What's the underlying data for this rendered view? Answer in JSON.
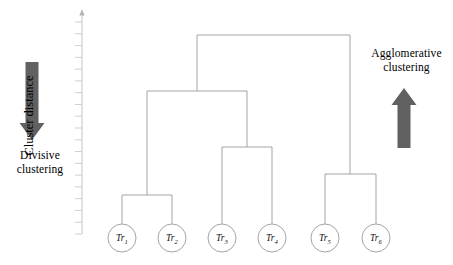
{
  "figure": {
    "type": "dendrogram",
    "background_color": "#ffffff",
    "line_color": "#9a9a9a",
    "arrow_color": "#616161",
    "text_color": "#000000"
  },
  "axis": {
    "title": "Cluster distance",
    "has_arrow_head": true,
    "tick_count": 19,
    "x": 82,
    "top_y": 14,
    "bottom_y": 234,
    "tick_length": 7
  },
  "annotations": {
    "left": {
      "label_line1": "Divisive",
      "label_line2": "clustering",
      "arrow_direction": "down",
      "arrow_name": "down-arrow"
    },
    "right": {
      "label_line1": "Agglomerative",
      "label_line2": "clustering",
      "arrow_direction": "up",
      "arrow_name": "up-arrow"
    }
  },
  "chart_data": {
    "type": "dendrogram",
    "title": "",
    "xlabel": "",
    "ylabel": "Cluster distance",
    "grid": false,
    "legend": "none",
    "leaves": [
      {
        "id": "Tr1",
        "base": "Tr",
        "sub": "1",
        "x": 122,
        "y": 238,
        "radius": 14
      },
      {
        "id": "Tr2",
        "base": "Tr",
        "sub": "2",
        "x": 172,
        "y": 238,
        "radius": 14
      },
      {
        "id": "Tr3",
        "base": "Tr",
        "sub": "3",
        "x": 222,
        "y": 238,
        "radius": 14
      },
      {
        "id": "Tr4",
        "base": "Tr",
        "sub": "4",
        "x": 272,
        "y": 238,
        "radius": 14
      },
      {
        "id": "Tr5",
        "base": "Tr",
        "sub": "5",
        "x": 325,
        "y": 238,
        "radius": 14
      },
      {
        "id": "Tr6",
        "base": "Tr",
        "sub": "6",
        "x": 376,
        "y": 238,
        "radius": 14
      }
    ],
    "merges": [
      {
        "name": "merge-Tr1-Tr2",
        "left_x": 122,
        "right_x": 172,
        "height_y": 195,
        "center_x": 147,
        "children": [
          "Tr1",
          "Tr2"
        ]
      },
      {
        "name": "merge-Tr3-Tr4",
        "left_x": 222,
        "right_x": 272,
        "height_y": 147,
        "center_x": 247,
        "children": [
          "Tr3",
          "Tr4"
        ]
      },
      {
        "name": "merge-Tr5-Tr6",
        "left_x": 325,
        "right_x": 376,
        "height_y": 174,
        "center_x": 350,
        "children": [
          "Tr5",
          "Tr6"
        ]
      },
      {
        "name": "merge-Tr12-Tr34",
        "left_x": 147,
        "right_x": 247,
        "height_y": 91,
        "center_x": 197,
        "children": [
          "merge-Tr1-Tr2",
          "merge-Tr3-Tr4"
        ]
      },
      {
        "name": "merge-root",
        "left_x": 197,
        "right_x": 350,
        "height_y": 35,
        "center_x": 273,
        "children": [
          "merge-Tr12-Tr34",
          "merge-Tr5-Tr6"
        ]
      }
    ]
  }
}
